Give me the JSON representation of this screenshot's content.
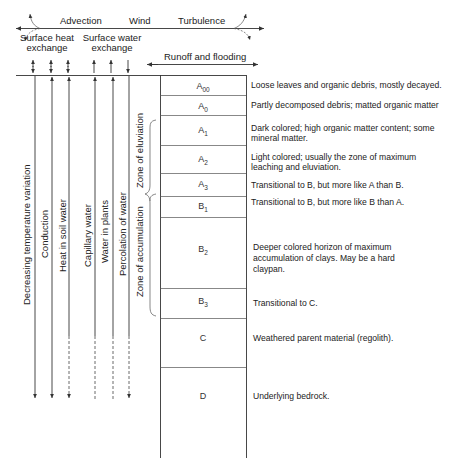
{
  "atmosphere": {
    "top_labels": [
      "Advection",
      "Wind",
      "Turbulence"
    ],
    "surface_heat_exchange": [
      "Surface heat",
      "exchange"
    ],
    "surface_water_exchange": [
      "Surface water",
      "exchange"
    ],
    "runoff_label": "Runoff and flooding"
  },
  "processes": [
    {
      "label": "Decreasing temperature variation",
      "x": 35,
      "style": "solid"
    },
    {
      "label": "Conduction",
      "x": 52,
      "style": "solid"
    },
    {
      "label": "Heat in soil water",
      "x": 69,
      "style": "solid-then-dashed"
    },
    {
      "label": "Capillary water",
      "x": 95,
      "style": "solid-then-dashed"
    },
    {
      "label": "Water in plants",
      "x": 113,
      "style": "solid-then-dashed"
    },
    {
      "label": "Percolation of water",
      "x": 129,
      "style": "solid-then-dashed"
    }
  ],
  "zones": {
    "eluviation": "Zone of eluviation",
    "accumulation": "Zone of accumulation"
  },
  "horizons": [
    {
      "name": "A",
      "sub": "00",
      "top": 75,
      "bottom": 95,
      "description": [
        "Loose leaves and organic debris, mostly decayed."
      ]
    },
    {
      "name": "A",
      "sub": "0",
      "top": 95,
      "bottom": 115,
      "description": [
        "Partly decomposed debris;  matted organic matter"
      ]
    },
    {
      "name": "A",
      "sub": "1",
      "top": 115,
      "bottom": 145,
      "description": [
        "Dark colored; high organic matter content; some",
        "mineral matter."
      ]
    },
    {
      "name": "A",
      "sub": "2",
      "top": 145,
      "bottom": 173,
      "description": [
        "Light colored; usually the zone of maximum",
        "leaching and eluviation."
      ]
    },
    {
      "name": "A",
      "sub": "3",
      "top": 173,
      "bottom": 196,
      "description": [
        "Transitional to B, but more like A than B."
      ]
    },
    {
      "name": "B",
      "sub": "1",
      "top": 196,
      "bottom": 217,
      "description": [
        "Transitional to B,  but more like B than A."
      ]
    },
    {
      "name": "B",
      "sub": "2",
      "top": 217,
      "bottom": 288,
      "description": [
        "Deeper colored horizon of maximum",
        "accumulation of clays. May be a hard",
        "claypan."
      ]
    },
    {
      "name": "B",
      "sub": "3",
      "top": 288,
      "bottom": 318,
      "description": [
        "Transitional to C."
      ]
    },
    {
      "name": "C",
      "sub": "",
      "top": 318,
      "bottom": 367,
      "description": [
        "Weathered parent material (regolith)."
      ]
    },
    {
      "name": "D",
      "sub": "",
      "top": 367,
      "bottom": 458,
      "description": [
        "Underlying bedrock."
      ]
    }
  ]
}
